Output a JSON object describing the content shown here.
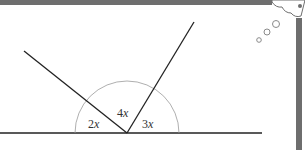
{
  "diagram": {
    "angles": [
      {
        "label_coef": "2",
        "label_var": "x",
        "position": "left"
      },
      {
        "label_coef": "4",
        "label_var": "x",
        "position": "middle"
      },
      {
        "label_coef": "3",
        "label_var": "x",
        "position": "right"
      }
    ],
    "colors": {
      "frame": "#6e6e6e",
      "lines": "#222222",
      "arc": "#9a9a9a",
      "text": "#333333"
    },
    "decoration": "thought-bubble"
  }
}
